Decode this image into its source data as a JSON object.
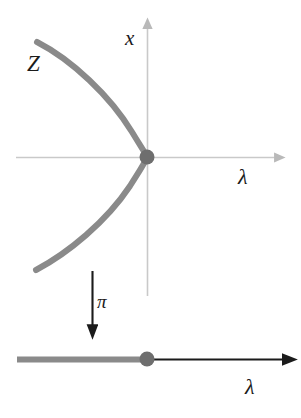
{
  "figure": {
    "kind": "mathematical-diagram",
    "background_color": "#ffffff",
    "curve_color": "#8a8a8a",
    "axis_color": "#c9c9c9",
    "arrow_color": "#1b1b1b",
    "dot_color": "#6e6e6e"
  },
  "top_panel": {
    "name": "total-space-plane",
    "vertical_axis": {
      "label": "x",
      "x": 147,
      "y_top": 22,
      "y_bottom": 296
    },
    "horizontal_axis": {
      "label": "λ",
      "y": 157,
      "x_left": 16,
      "x_right": 281
    },
    "curve": {
      "label": "Z",
      "shape": "leftward-opening-parabola",
      "vertex": [
        147,
        157
      ],
      "upper_endpoint": [
        37,
        42
      ],
      "lower_endpoint": [
        36,
        270
      ],
      "stroke_width": 6
    },
    "origin_point": {
      "label": "",
      "x": 147,
      "y": 157,
      "radius": 7
    }
  },
  "projection": {
    "name": "projection-arrow",
    "label": "π",
    "x": 92,
    "y_start": 271,
    "y_end": 333,
    "direction": "down"
  },
  "bottom_panel": {
    "name": "base-line",
    "axis": {
      "label": "λ",
      "y": 359,
      "x_left": 17,
      "x_right": 291
    },
    "image_segment": {
      "x_start": 17,
      "x_end": 147,
      "stroke_width": 6,
      "color": "#8a8a8a"
    },
    "origin_point": {
      "x": 147,
      "y": 359,
      "radius": 7
    }
  }
}
